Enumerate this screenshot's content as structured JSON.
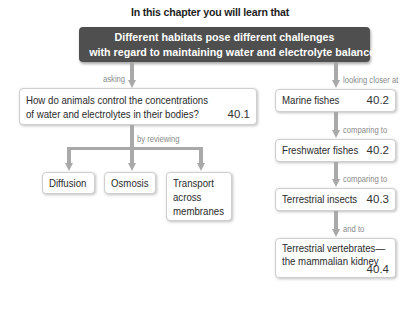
{
  "title": "In this chapter you will learn that",
  "header": {
    "line1": "Different habitats pose different challenges",
    "line2": "with regard to maintaining water and electrolyte balance"
  },
  "left_branch": {
    "connector_label": "asking",
    "question": {
      "line1": "How do animals control the concentrations",
      "line2": "of water and electrolytes in their bodies?",
      "section": "40.1"
    },
    "sub_connector_label": "by reviewing",
    "topics": [
      {
        "label": "Diffusion"
      },
      {
        "label": "Osmosis"
      },
      {
        "lines": [
          "Transport",
          "across",
          "membranes"
        ]
      }
    ]
  },
  "right_branch": {
    "connector_label": "looking closer at",
    "items": [
      {
        "label": "Marine fishes",
        "section": "40.2"
      },
      {
        "connector_label": "comparing to",
        "label": "Freshwater fishes",
        "section": "40.2"
      },
      {
        "connector_label": "comparing to",
        "label": "Terrestrial insects",
        "section": "40.3"
      },
      {
        "connector_label": "and to",
        "line1": "Terrestrial vertebrates—",
        "line2": "the mammalian kidney",
        "section": "40.4"
      }
    ]
  }
}
